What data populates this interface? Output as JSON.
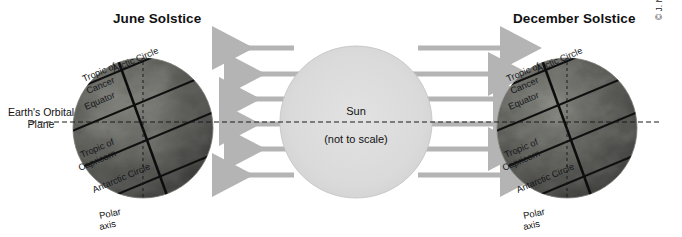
{
  "figure": {
    "left_panel_title": "June Solstice",
    "right_panel_title": "December Solstice",
    "orbital_plane_label_line1": "Earth's Orbital",
    "orbital_plane_label_line2": "Plane",
    "copyright": "© J. Nijman, M. Shin, P. O. Muller, and John Wiley & Sons, Inc."
  },
  "sun": {
    "name": "Sun",
    "note": "(not to scale)",
    "fill_color": "#d8d8d8",
    "edge_color": "#c6c6c6",
    "center_x": 356,
    "center_y": 122,
    "radius": 76
  },
  "globes": {
    "june": {
      "center_x": 143,
      "center_y": 128,
      "radius": 70,
      "labels": {
        "arctic_circle": "Arctic Circle",
        "tropic_of_cancer_line1": "Tropic of",
        "tropic_of_cancer_line2": "Cancer",
        "equator": "Equator",
        "tropic_of_capricorn_line1": "Tropic of",
        "tropic_of_capricorn_line2": "Capricorn",
        "antarctic_circle": "Antarctic Circle",
        "polar_axis_line1": "Polar",
        "polar_axis_line2": "axis"
      }
    },
    "december": {
      "center_x": 567,
      "center_y": 128,
      "radius": 70,
      "labels": {
        "arctic_circle": "Arctic Circle",
        "tropic_of_cancer_line1": "Tropic of",
        "tropic_of_cancer_line2": "Cancer",
        "equator": "Equator",
        "tropic_of_capricorn_line1": "Tropic of",
        "tropic_of_capricorn_line2": "Capricorn",
        "antarctic_circle": "Antarctic Circle",
        "polar_axis_line1": "Polar",
        "polar_axis_line2": "axis"
      }
    }
  },
  "rays": {
    "color": "#b4b4b4",
    "count_per_side": 6,
    "y_positions": [
      48,
      74,
      99,
      124,
      149,
      175
    ],
    "direction_left": "left",
    "direction_right": "right"
  },
  "orbital_plane_line": {
    "y": 122,
    "style": "dashed",
    "color": "#1a1a1a"
  }
}
